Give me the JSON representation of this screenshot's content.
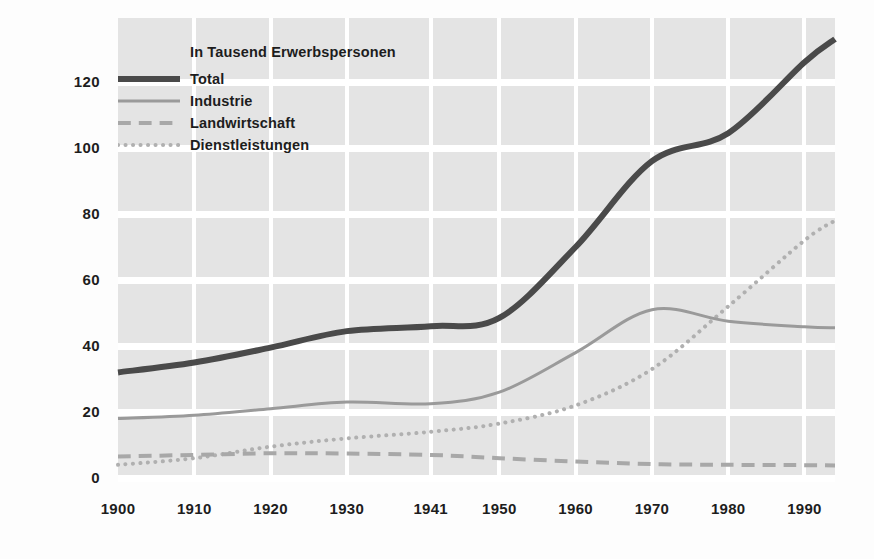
{
  "legend": {
    "title": "In Tausend Erwerbspersonen",
    "entries": [
      {
        "label": "Total",
        "style": "solid-thick",
        "color": "#4a4a4a"
      },
      {
        "label": "Industrie",
        "style": "solid-thin",
        "color": "#9a9a9a"
      },
      {
        "label": "Landwirtschaft",
        "style": "dashed",
        "color": "#a8a8a8"
      },
      {
        "label": "Dienstleistungen",
        "style": "dotted",
        "color": "#b0b0b0"
      }
    ]
  },
  "axes": {
    "y_ticks": [
      "0",
      "20",
      "40",
      "60",
      "80",
      "100",
      "120"
    ],
    "x_ticks": [
      "1900",
      "1910",
      "1920",
      "1930",
      "1941",
      "1950",
      "1960",
      "1970",
      "1980",
      "1990"
    ]
  },
  "chart_data": {
    "type": "line",
    "title": "In Tausend Erwerbspersonen",
    "xlabel": "",
    "ylabel": "In Tausend Erwerbspersonen",
    "xlim": [
      1900,
      1994
    ],
    "ylim": [
      0,
      135
    ],
    "ytick_values": [
      0,
      20,
      40,
      60,
      80,
      100,
      120
    ],
    "xtick_values": [
      1900,
      1910,
      1920,
      1930,
      1941,
      1950,
      1960,
      1970,
      1980,
      1990
    ],
    "grid": "horizontal-bands-with-vertical-white-separators",
    "legend_position": "upper-left-inside",
    "x": [
      1900,
      1910,
      1920,
      1930,
      1941,
      1950,
      1960,
      1970,
      1980,
      1990,
      1994
    ],
    "series": [
      {
        "name": "Total",
        "color": "#4a4a4a",
        "linestyle": "solid",
        "linewidth": 6,
        "values": [
          32,
          35,
          39.5,
          44.5,
          46,
          48.5,
          70,
          96,
          104.5,
          126,
          133
        ]
      },
      {
        "name": "Industrie",
        "color": "#9a9a9a",
        "linestyle": "solid",
        "linewidth": 3,
        "values": [
          18,
          19,
          21,
          23,
          22.5,
          26,
          38,
          51,
          47.5,
          45.8,
          45.5
        ]
      },
      {
        "name": "Landwirtschaft",
        "color": "#a8a8a8",
        "linestyle": "dashed",
        "linewidth": 4,
        "values": [
          6.5,
          7,
          7.5,
          7.4,
          7,
          6,
          5,
          4.2,
          4,
          3.9,
          3.8
        ]
      },
      {
        "name": "Dienstleistungen",
        "color": "#b0b0b0",
        "linestyle": "dotted",
        "linewidth": 4,
        "values": [
          4,
          6,
          9.5,
          12,
          14,
          16.5,
          22,
          33,
          52,
          72,
          78
        ]
      }
    ],
    "annotations": [
      {
        "text": "Industrie peak approx. 52 around 1972"
      }
    ]
  },
  "colors": {
    "band": "#e4e4e4",
    "background": "#ffffff",
    "text": "#1d1d1d"
  }
}
